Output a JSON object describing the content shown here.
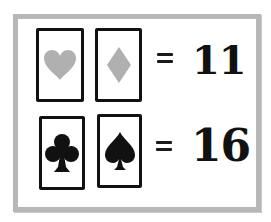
{
  "puzzle": {
    "rows": [
      {
        "cards": [
          {
            "suit": "heart",
            "icon": "heart-icon",
            "color": "#b0b0b0"
          },
          {
            "suit": "diamond",
            "icon": "diamond-icon",
            "color": "#b0b0b0"
          }
        ],
        "operator": "=",
        "value": "11"
      },
      {
        "cards": [
          {
            "suit": "club",
            "icon": "club-icon",
            "color": "#111111"
          },
          {
            "suit": "spade",
            "icon": "spade-icon",
            "color": "#111111"
          }
        ],
        "operator": "=",
        "value": "16"
      }
    ]
  },
  "colors": {
    "frame": "#b7b7b7",
    "card_border": "#111111",
    "red_suits_gray": "#b0b0b0",
    "black_suits": "#111111"
  }
}
